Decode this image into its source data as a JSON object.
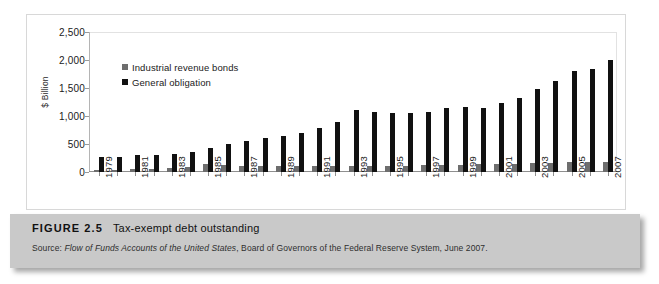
{
  "figure": {
    "number_label": "FIGURE 2.5",
    "caption": "Tax-exempt debt outstanding",
    "source_prefix": "Source: ",
    "source_italic": "Flow of Funds Accounts of the United States",
    "source_rest": ", Board of Governors of the Federal Reserve System, June 2007."
  },
  "colors": {
    "industrial_revenue_bonds": "#6e6e6e",
    "general_obligation": "#111111",
    "caption_band": "#c9c9c9",
    "panel_background": "#ffffff",
    "axis": "#8f8f8f"
  },
  "chart_data": {
    "type": "bar",
    "title": "Tax-exempt debt outstanding",
    "xlabel": "",
    "ylabel": "$ Billion",
    "ylim": [
      0,
      2500
    ],
    "yticks": [
      0,
      500,
      1000,
      1500,
      2000,
      2500
    ],
    "ytick_labels": [
      "0",
      "500",
      "1,000",
      "1,500",
      "2,000",
      "2,500"
    ],
    "grid": false,
    "legend_position": "upper-left",
    "categories": [
      "1979",
      "1980",
      "1981",
      "1982",
      "1983",
      "1984",
      "1985",
      "1986",
      "1987",
      "1988",
      "1989",
      "1990",
      "1991",
      "1992",
      "1993",
      "1994",
      "1995",
      "1996",
      "1997",
      "1998",
      "1999",
      "2000",
      "2001",
      "2002",
      "2003",
      "2004",
      "2005",
      "2006",
      "2007"
    ],
    "tick_labels": [
      "1979",
      "",
      "1981",
      "",
      "1983",
      "",
      "1985",
      "",
      "1987",
      "",
      "1989",
      "",
      "1991",
      "",
      "1993",
      "",
      "1995",
      "",
      "1997",
      "",
      "1999",
      "",
      "2001",
      "",
      "2003",
      "",
      "2005",
      "",
      "2007"
    ],
    "series": [
      {
        "name": "Industrial revenue bonds",
        "color": "#6e6e6e",
        "values": [
          30,
          35,
          45,
          60,
          75,
          95,
          140,
          120,
          110,
          105,
          100,
          100,
          105,
          110,
          115,
          115,
          115,
          115,
          120,
          125,
          130,
          135,
          140,
          150,
          160,
          165,
          170,
          175,
          180
        ]
      },
      {
        "name": "General obligation",
        "color": "#111111",
        "values": [
          265,
          275,
          300,
          310,
          330,
          360,
          430,
          500,
          560,
          600,
          650,
          700,
          790,
          900,
          1100,
          1080,
          1060,
          1060,
          1070,
          1150,
          1160,
          1150,
          1230,
          1330,
          1480,
          1620,
          1800,
          1840,
          2000
        ]
      }
    ]
  }
}
